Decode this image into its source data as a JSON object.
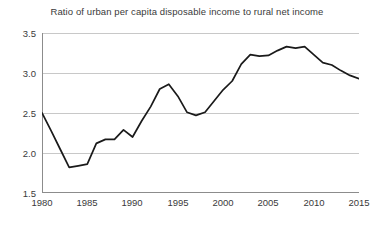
{
  "chart_data": {
    "type": "line",
    "title": "Ratio of urban per capita disposable income to rural net income",
    "xlabel": "",
    "ylabel": "",
    "xlim": [
      1980,
      2015
    ],
    "ylim": [
      1.5,
      3.5
    ],
    "grid": true,
    "legend": "none",
    "x_ticks": [
      "1980",
      "1985",
      "1990",
      "1995",
      "2000",
      "2005",
      "2010",
      "2015"
    ],
    "y_ticks": [
      "1.5",
      "2.0",
      "2.5",
      "3.0",
      "3.5"
    ],
    "line_color": "#1a1a1a",
    "grid_color": "#c8c8c8",
    "axis_color": "#8c8c8c",
    "x": [
      1980,
      1981,
      1982,
      1983,
      1984,
      1985,
      1986,
      1987,
      1988,
      1989,
      1990,
      1991,
      1992,
      1993,
      1994,
      1995,
      1996,
      1997,
      1998,
      1999,
      2000,
      2001,
      2002,
      2003,
      2004,
      2005,
      2006,
      2007,
      2008,
      2009,
      2010,
      2011,
      2012,
      2013,
      2014,
      2015
    ],
    "values": [
      2.5,
      2.28,
      2.05,
      1.82,
      1.84,
      1.86,
      2.12,
      2.17,
      2.17,
      2.29,
      2.2,
      2.4,
      2.58,
      2.8,
      2.86,
      2.71,
      2.51,
      2.47,
      2.51,
      2.65,
      2.79,
      2.9,
      3.11,
      3.23,
      3.21,
      3.22,
      3.28,
      3.33,
      3.31,
      3.33,
      3.23,
      3.13,
      3.1,
      3.03,
      2.97,
      2.93
    ]
  }
}
